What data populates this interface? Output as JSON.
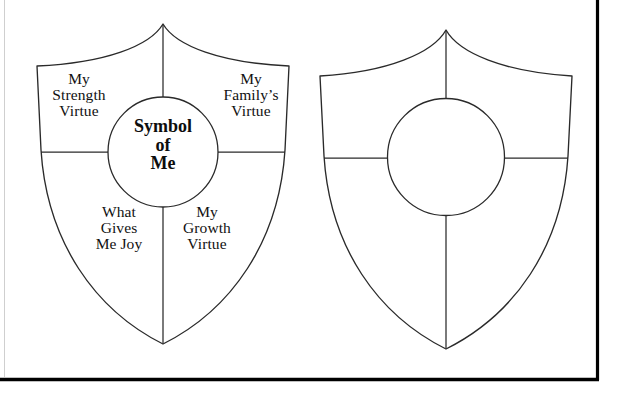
{
  "document": {
    "kind": "printable-worksheet",
    "background_color": "#ffffff",
    "ink_color": "#2a2a2a",
    "border_color": "#000000"
  },
  "shields": [
    {
      "id": "filled-shield",
      "name": "Symbol of Me shield with labels",
      "center": {
        "text": "Symbol\nof\nMe",
        "lines": [
          "Symbol",
          "of",
          "Me"
        ]
      },
      "quadrants": [
        {
          "position": "top-left",
          "text": "My\nStrength\nVirtue",
          "lines": [
            "My",
            "Strength",
            "Virtue"
          ]
        },
        {
          "position": "top-right",
          "text": "My\nFamily’s\nVirtue",
          "lines": [
            "My",
            "Family’s",
            "Virtue"
          ]
        },
        {
          "position": "bottom-left",
          "text": "What\nGives\nMe Joy",
          "lines": [
            "What",
            "Gives",
            "Me Joy"
          ]
        },
        {
          "position": "bottom-right",
          "text": "My\nGrowth\nVirtue",
          "lines": [
            "My",
            "Growth",
            "Virtue"
          ]
        }
      ]
    },
    {
      "id": "blank-shield",
      "name": "Blank shield template",
      "center": {
        "text": "",
        "lines": []
      },
      "quadrants": [
        {
          "position": "top-left",
          "text": "",
          "lines": []
        },
        {
          "position": "top-right",
          "text": "",
          "lines": []
        },
        {
          "position": "bottom-left",
          "text": "",
          "lines": []
        },
        {
          "position": "bottom-right",
          "text": "",
          "lines": []
        }
      ]
    }
  ]
}
